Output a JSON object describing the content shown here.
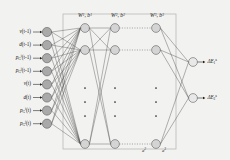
{
  "diagram": {
    "background_color": "#f2f2f0",
    "frame_color": "#b9b9b9",
    "edge_color": "#4a4a4a",
    "input_node_fill": "#a9a9a9",
    "hidden_node_fill": "#d4d4d4",
    "output_node_fill": "#e8e8e8",
    "node_stroke": "#555555"
  },
  "weights": [
    {
      "name": "layer1-weights",
      "W": "W",
      "W_sup": "1",
      "b": "b",
      "b_sup": "1",
      "text": "W 1 , b 1"
    },
    {
      "name": "layer2-weights",
      "W": "W",
      "W_sup": "2",
      "b": "b",
      "b_sup": "2",
      "text": "W 2 , b 2"
    },
    {
      "name": "layer3-weights",
      "W": "W",
      "W_sup": "3",
      "b": "b",
      "b_sup": "3",
      "text": "W 3 , b 3"
    }
  ],
  "inputs": [
    {
      "base": "v",
      "sub": "",
      "arg": "(t-1)"
    },
    {
      "base": "d",
      "sub": "",
      "arg": "(t-1)"
    },
    {
      "base": "p",
      "sub": "G",
      "sup": "i",
      "arg": "(t-1)"
    },
    {
      "base": "p",
      "sub": "G",
      "sup": "j",
      "arg": "(t-1)"
    },
    {
      "base": "v",
      "sub": "",
      "arg": "(t)"
    },
    {
      "base": "d",
      "sub": "",
      "arg": "(t)"
    },
    {
      "base": "p",
      "sub": "G",
      "sup": "i",
      "arg": "(t)"
    },
    {
      "base": "p",
      "sub": "G",
      "sup": "j",
      "arg": "(t)"
    }
  ],
  "outputs": [
    {
      "base": "ΔE",
      "sub": "1",
      "sup": "a",
      "text": "ΔE"
    },
    {
      "base": "ΔE",
      "sub": "2",
      "sup": "a",
      "text": "ΔE"
    }
  ],
  "hidden_layer_annotations": [
    {
      "base": "a",
      "sup": "2"
    },
    {
      "base": "a",
      "sup": "3"
    }
  ],
  "layers": {
    "input_count": 8,
    "hidden_layers": 3,
    "hidden_visible_top": 2,
    "hidden_visible_bottom": 1,
    "ellipsis_dots": 3,
    "output_count": 2
  }
}
